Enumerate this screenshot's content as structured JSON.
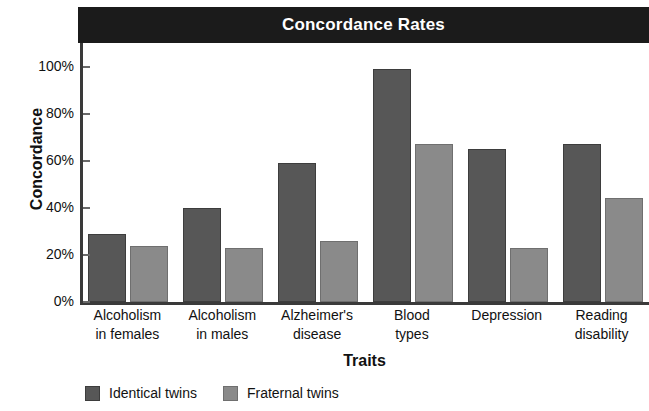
{
  "chart_data": {
    "type": "bar",
    "title": "Concordance Rates",
    "xlabel": "Traits",
    "ylabel": "Concordance",
    "categories": [
      "Alcoholism in females",
      "Alcoholism in males",
      "Alzheimer's disease",
      "Blood types",
      "Depression",
      "Reading disability"
    ],
    "category_lines": [
      [
        "Alcoholism",
        "in females"
      ],
      [
        "Alcoholism",
        "in males"
      ],
      [
        "Alzheimer's",
        "disease"
      ],
      [
        "Blood",
        "types"
      ],
      [
        "Depression",
        ""
      ],
      [
        "Reading",
        "disability"
      ]
    ],
    "series": [
      {
        "name": "Identical twins",
        "color": "#575757",
        "values": [
          29,
          40,
          59,
          99,
          65,
          67
        ]
      },
      {
        "name": "Fraternal twins",
        "color": "#8a8a8a",
        "values": [
          24,
          23,
          26,
          67,
          23,
          44
        ]
      }
    ],
    "ylim": [
      0,
      110
    ],
    "yticks": [
      0,
      20,
      40,
      60,
      80,
      100
    ],
    "ytick_labels": [
      "0%",
      "20%",
      "40%",
      "60%",
      "80%",
      "100%"
    ],
    "grid": false,
    "legend_position": "bottom-left",
    "value_unit": "%"
  },
  "figure": {
    "title_band_color": "#1b1b1b",
    "title_text_color": "#ffffff",
    "background": "#ffffff",
    "axis_color": "#3a3a3a"
  }
}
